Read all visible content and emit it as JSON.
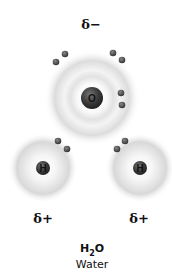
{
  "molecule": {
    "formula_main": "H",
    "formula_sub": "2",
    "formula_end": "O",
    "name": "Water"
  },
  "charges": {
    "oxygen": "δ−",
    "hydrogen_left": "δ+",
    "hydrogen_right": "δ+"
  },
  "atoms": [
    {
      "symbol": "O",
      "x": 92,
      "y": 98,
      "nucleus_r": 11,
      "cloud_r": 48
    },
    {
      "symbol": "H",
      "x": 43,
      "y": 168,
      "nucleus_r": 7,
      "cloud_r": 35
    },
    {
      "symbol": "H",
      "x": 140,
      "y": 168,
      "nucleus_r": 7,
      "cloud_r": 35
    }
  ],
  "electrons": [
    {
      "x": 56,
      "y": 62
    },
    {
      "x": 65,
      "y": 54
    },
    {
      "x": 113,
      "y": 53
    },
    {
      "x": 122,
      "y": 60
    },
    {
      "x": 121,
      "y": 93
    },
    {
      "x": 122,
      "y": 105
    },
    {
      "x": 58,
      "y": 141
    },
    {
      "x": 67,
      "y": 149
    },
    {
      "x": 125,
      "y": 141
    },
    {
      "x": 117,
      "y": 149
    }
  ],
  "colors": {
    "nucleus": "#3a3a3a",
    "electron": "#555555",
    "cloud": "#d9d9d9"
  }
}
